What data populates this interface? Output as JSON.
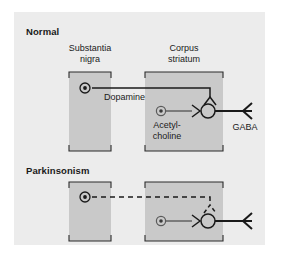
{
  "figure": {
    "kind": "neuroanatomy-pathway-diagram",
    "background_color": "#ffffff",
    "panel_color": "#ececec",
    "region_fill_color": "#c9c9c9",
    "line_color": "#1a1a1a",
    "panels": [
      {
        "id": "normal",
        "title": "Normal",
        "regions": [
          {
            "id": "substantia-nigra",
            "label_line1": "Substantia",
            "label_line2": "nigra"
          },
          {
            "id": "corpus-striatum",
            "label_line1": "Corpus",
            "label_line2": "striatum"
          }
        ],
        "neurotransmitters": [
          {
            "id": "dopamine",
            "label": "Dopamine",
            "pathway": "solid"
          },
          {
            "id": "acetylcholine",
            "label_line1": "Acetyl-",
            "label_line2": "choline",
            "pathway": "solid"
          },
          {
            "id": "gaba",
            "label": "GABA",
            "pathway": "solid"
          }
        ]
      },
      {
        "id": "parkinsonism",
        "title": "Parkinsonism",
        "regions": [
          {
            "id": "substantia-nigra",
            "label_line1": "",
            "label_line2": ""
          },
          {
            "id": "corpus-striatum",
            "label_line1": "",
            "label_line2": ""
          }
        ],
        "neurotransmitters": [
          {
            "id": "dopamine",
            "label": "",
            "pathway": "dashed"
          },
          {
            "id": "acetylcholine",
            "label": "",
            "pathway": "solid"
          },
          {
            "id": "gaba",
            "label": "",
            "pathway": "solid"
          }
        ]
      }
    ]
  },
  "labels": {
    "normal_title": "Normal",
    "parkinsonism_title": "Parkinsonism",
    "substantia_l1": "Substantia",
    "substantia_l2": "nigra",
    "corpus_l1": "Corpus",
    "corpus_l2": "striatum",
    "dopamine": "Dopamine",
    "acetylcholine_l1": "Acetyl-",
    "acetylcholine_l2": "choline",
    "gaba": "GABA"
  }
}
